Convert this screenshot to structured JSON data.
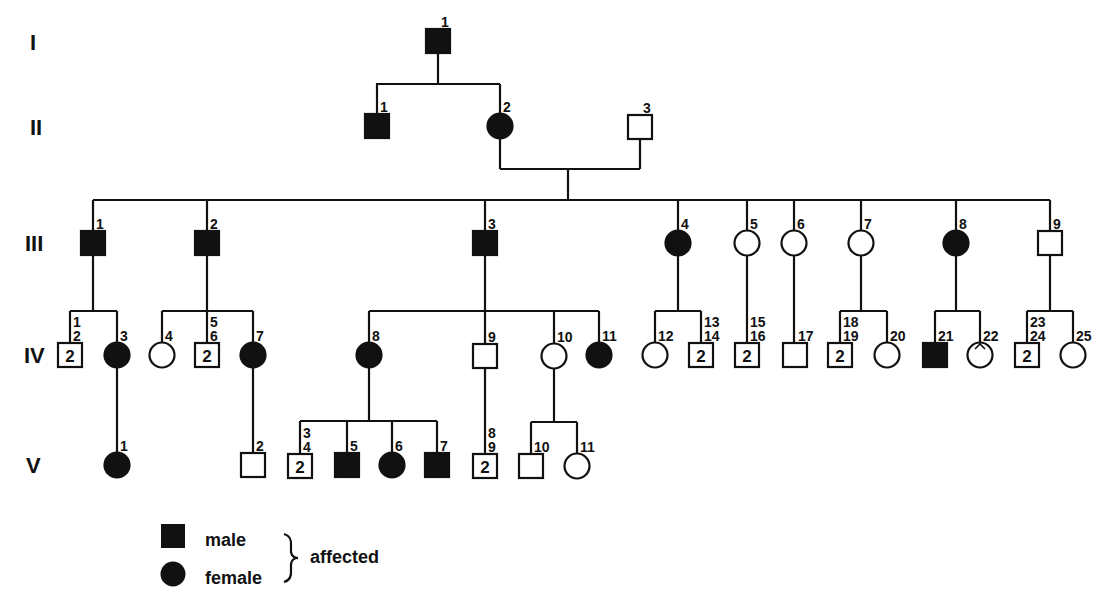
{
  "diagram": {
    "type": "pedigree",
    "ink_color": "#111111",
    "background": "#ffffff",
    "generations": [
      {
        "label": "I",
        "y": 42
      },
      {
        "label": "II",
        "y": 127
      },
      {
        "label": "III",
        "y": 243
      },
      {
        "label": "IV",
        "y": 355
      },
      {
        "label": "V",
        "y": 465
      }
    ],
    "individuals": [
      {
        "id": "I-1",
        "gen": "I",
        "sex": "male",
        "affected": true,
        "x": 438,
        "y": 41,
        "label": "1"
      },
      {
        "id": "II-1",
        "gen": "II",
        "sex": "male",
        "affected": true,
        "x": 377,
        "y": 126,
        "label": "1"
      },
      {
        "id": "II-2",
        "gen": "II",
        "sex": "female",
        "affected": true,
        "x": 500,
        "y": 126,
        "label": "2"
      },
      {
        "id": "II-3",
        "gen": "II",
        "sex": "male",
        "affected": false,
        "x": 640,
        "y": 127,
        "label": "3"
      },
      {
        "id": "III-1",
        "gen": "III",
        "sex": "male",
        "affected": true,
        "x": 93,
        "y": 243,
        "label": "1"
      },
      {
        "id": "III-2",
        "gen": "III",
        "sex": "male",
        "affected": true,
        "x": 207,
        "y": 243,
        "label": "2"
      },
      {
        "id": "III-3",
        "gen": "III",
        "sex": "male",
        "affected": true,
        "x": 485,
        "y": 243,
        "label": "3"
      },
      {
        "id": "III-4",
        "gen": "III",
        "sex": "female",
        "affected": true,
        "x": 678,
        "y": 243,
        "label": "4"
      },
      {
        "id": "III-5",
        "gen": "III",
        "sex": "female",
        "affected": false,
        "x": 747,
        "y": 243,
        "label": "5"
      },
      {
        "id": "III-6",
        "gen": "III",
        "sex": "female",
        "affected": false,
        "x": 794,
        "y": 243,
        "label": "6"
      },
      {
        "id": "III-7",
        "gen": "III",
        "sex": "female",
        "affected": false,
        "x": 861,
        "y": 243,
        "label": "7"
      },
      {
        "id": "III-8",
        "gen": "III",
        "sex": "female",
        "affected": true,
        "x": 956,
        "y": 243,
        "label": "8"
      },
      {
        "id": "III-9",
        "gen": "III",
        "sex": "male",
        "affected": false,
        "x": 1050,
        "y": 243,
        "label": "9"
      },
      {
        "id": "IV-1,2",
        "gen": "IV",
        "sex": "male",
        "affected": false,
        "x": 70,
        "y": 355,
        "label": "1\n2",
        "count": "2"
      },
      {
        "id": "IV-3",
        "gen": "IV",
        "sex": "female",
        "affected": true,
        "x": 117,
        "y": 355,
        "label": "3"
      },
      {
        "id": "IV-4",
        "gen": "IV",
        "sex": "female",
        "affected": false,
        "x": 162,
        "y": 355,
        "label": "4"
      },
      {
        "id": "IV-5,6",
        "gen": "IV",
        "sex": "male",
        "affected": false,
        "x": 207,
        "y": 355,
        "label": "5\n6",
        "count": "2"
      },
      {
        "id": "IV-7",
        "gen": "IV",
        "sex": "female",
        "affected": true,
        "x": 253,
        "y": 355,
        "label": "7"
      },
      {
        "id": "IV-8",
        "gen": "IV",
        "sex": "female",
        "affected": true,
        "x": 369,
        "y": 355,
        "label": "8"
      },
      {
        "id": "IV-9",
        "gen": "IV",
        "sex": "male",
        "affected": false,
        "x": 485,
        "y": 356,
        "label": "9"
      },
      {
        "id": "IV-10",
        "gen": "IV",
        "sex": "female",
        "affected": false,
        "x": 554,
        "y": 356,
        "label": "10"
      },
      {
        "id": "IV-11",
        "gen": "IV",
        "sex": "female",
        "affected": true,
        "x": 599,
        "y": 355,
        "label": "11"
      },
      {
        "id": "IV-12",
        "gen": "IV",
        "sex": "female",
        "affected": false,
        "x": 655,
        "y": 355,
        "label": "12"
      },
      {
        "id": "IV-13,14",
        "gen": "IV",
        "sex": "male",
        "affected": false,
        "x": 701,
        "y": 355,
        "label": "13\n14",
        "count": "2"
      },
      {
        "id": "IV-15,16",
        "gen": "IV",
        "sex": "male",
        "affected": false,
        "x": 747,
        "y": 355,
        "label": "15\n16",
        "count": "2"
      },
      {
        "id": "IV-17",
        "gen": "IV",
        "sex": "male",
        "affected": false,
        "x": 795,
        "y": 355,
        "label": "17"
      },
      {
        "id": "IV-18,19",
        "gen": "IV",
        "sex": "male",
        "affected": false,
        "x": 840,
        "y": 355,
        "label": "18\n19",
        "count": "2"
      },
      {
        "id": "IV-20",
        "gen": "IV",
        "sex": "female",
        "affected": false,
        "x": 887,
        "y": 355,
        "label": "20"
      },
      {
        "id": "IV-21",
        "gen": "IV",
        "sex": "male",
        "affected": true,
        "x": 935,
        "y": 355,
        "label": "21"
      },
      {
        "id": "IV-22",
        "gen": "IV",
        "sex": "female",
        "affected": false,
        "x": 980,
        "y": 355,
        "label": "22",
        "mark": "caret"
      },
      {
        "id": "IV-23,24",
        "gen": "IV",
        "sex": "male",
        "affected": false,
        "x": 1027,
        "y": 355,
        "label": "23\n24",
        "count": "2"
      },
      {
        "id": "IV-25",
        "gen": "IV",
        "sex": "female",
        "affected": false,
        "x": 1073,
        "y": 355,
        "label": "25"
      },
      {
        "id": "V-1",
        "gen": "V",
        "sex": "female",
        "affected": true,
        "x": 117,
        "y": 465,
        "label": "1"
      },
      {
        "id": "V-2",
        "gen": "V",
        "sex": "male",
        "affected": false,
        "x": 253,
        "y": 465,
        "label": "2"
      },
      {
        "id": "V-3,4",
        "gen": "V",
        "sex": "male",
        "affected": false,
        "x": 300,
        "y": 466,
        "label": "3\n4",
        "count": "2"
      },
      {
        "id": "V-5",
        "gen": "V",
        "sex": "male",
        "affected": true,
        "x": 347,
        "y": 465,
        "label": "5"
      },
      {
        "id": "V-6",
        "gen": "V",
        "sex": "female",
        "affected": true,
        "x": 392,
        "y": 465,
        "label": "6"
      },
      {
        "id": "V-7",
        "gen": "V",
        "sex": "male",
        "affected": true,
        "x": 437,
        "y": 465,
        "label": "7"
      },
      {
        "id": "V-8,9",
        "gen": "V",
        "sex": "male",
        "affected": false,
        "x": 485,
        "y": 466,
        "label": "8\n9",
        "count": "2"
      },
      {
        "id": "V-10",
        "gen": "V",
        "sex": "male",
        "affected": false,
        "x": 531,
        "y": 466,
        "label": "10"
      },
      {
        "id": "V-11",
        "gen": "V",
        "sex": "female",
        "affected": false,
        "x": 577,
        "y": 466,
        "label": "11"
      }
    ],
    "lines": [
      [
        438,
        53,
        438,
        84
      ],
      [
        376,
        84,
        500,
        84
      ],
      [
        377,
        84,
        377,
        114
      ],
      [
        500,
        84,
        500,
        114
      ],
      [
        500,
        139,
        500,
        169
      ],
      [
        640,
        140,
        640,
        169
      ],
      [
        500,
        169,
        640,
        169
      ],
      [
        568,
        169,
        568,
        200
      ],
      [
        93,
        200,
        1050,
        200
      ],
      [
        93,
        200,
        93,
        231
      ],
      [
        207,
        200,
        207,
        231
      ],
      [
        485,
        200,
        485,
        231
      ],
      [
        678,
        200,
        678,
        231
      ],
      [
        747,
        200,
        747,
        231
      ],
      [
        794,
        200,
        794,
        231
      ],
      [
        861,
        200,
        861,
        231
      ],
      [
        956,
        200,
        956,
        231
      ],
      [
        1050,
        200,
        1050,
        231
      ],
      [
        93,
        256,
        93,
        311
      ],
      [
        70,
        311,
        117,
        311
      ],
      [
        70,
        311,
        70,
        343
      ],
      [
        117,
        311,
        117,
        343
      ],
      [
        207,
        256,
        207,
        311
      ],
      [
        162,
        311,
        253,
        311
      ],
      [
        162,
        311,
        162,
        343
      ],
      [
        207,
        311,
        207,
        343
      ],
      [
        253,
        311,
        253,
        343
      ],
      [
        485,
        256,
        485,
        311
      ],
      [
        369,
        311,
        599,
        311
      ],
      [
        369,
        311,
        369,
        343
      ],
      [
        485,
        311,
        485,
        344
      ],
      [
        554,
        311,
        554,
        344
      ],
      [
        599,
        311,
        599,
        343
      ],
      [
        678,
        256,
        678,
        311
      ],
      [
        655,
        311,
        701,
        311
      ],
      [
        655,
        311,
        655,
        343
      ],
      [
        701,
        311,
        701,
        343
      ],
      [
        747,
        256,
        747,
        343
      ],
      [
        794,
        256,
        794,
        343
      ],
      [
        861,
        256,
        861,
        311
      ],
      [
        840,
        311,
        887,
        311
      ],
      [
        840,
        311,
        840,
        343
      ],
      [
        887,
        311,
        887,
        343
      ],
      [
        956,
        256,
        956,
        311
      ],
      [
        935,
        311,
        980,
        311
      ],
      [
        935,
        311,
        935,
        343
      ],
      [
        980,
        311,
        980,
        343
      ],
      [
        1050,
        256,
        1050,
        311
      ],
      [
        1027,
        311,
        1073,
        311
      ],
      [
        1027,
        311,
        1027,
        343
      ],
      [
        1073,
        311,
        1073,
        343
      ],
      [
        117,
        367,
        117,
        453
      ],
      [
        253,
        367,
        253,
        453
      ],
      [
        369,
        367,
        369,
        421
      ],
      [
        300,
        421,
        437,
        421
      ],
      [
        300,
        421,
        300,
        454
      ],
      [
        347,
        421,
        347,
        453
      ],
      [
        392,
        421,
        392,
        453
      ],
      [
        437,
        421,
        437,
        453
      ],
      [
        485,
        368,
        485,
        454
      ],
      [
        554,
        368,
        554,
        422
      ],
      [
        531,
        422,
        577,
        422
      ],
      [
        531,
        422,
        531,
        454
      ],
      [
        577,
        422,
        577,
        454
      ]
    ]
  },
  "legend": {
    "male_label": "male",
    "female_label": "female",
    "group_label": "affected"
  }
}
